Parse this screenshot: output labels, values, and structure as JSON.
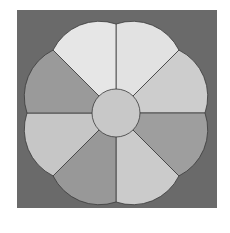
{
  "figure": {
    "background_color": "#ffffff",
    "square": {
      "x": 17,
      "y": 10,
      "width": 200,
      "height": 198,
      "color": "#6a6a6a"
    },
    "center": {
      "cx": 116,
      "cy": 113
    },
    "hub": {
      "radius": 24,
      "color": "#c8c8c8"
    },
    "notch_radius": 89,
    "arc_radius": 51.7,
    "outline_color": "#3a3a3a",
    "petals": [
      {
        "start_deg": -90,
        "end_deg": -45,
        "color": "#e2e2e2"
      },
      {
        "start_deg": -45,
        "end_deg": 0,
        "color": "#cdcdcd"
      },
      {
        "start_deg": 0,
        "end_deg": 45,
        "color": "#9e9e9e"
      },
      {
        "start_deg": 45,
        "end_deg": 90,
        "color": "#cbcbcb"
      },
      {
        "start_deg": 90,
        "end_deg": 135,
        "color": "#989898"
      },
      {
        "start_deg": 135,
        "end_deg": 180,
        "color": "#c6c6c6"
      },
      {
        "start_deg": 180,
        "end_deg": 225,
        "color": "#9a9a9a"
      },
      {
        "start_deg": 225,
        "end_deg": 270,
        "color": "#e6e6e6"
      }
    ]
  }
}
